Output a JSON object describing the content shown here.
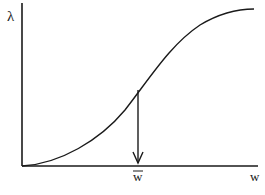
{
  "diagram": {
    "type": "sigmoid-curve-plot",
    "y_axis_label": "λ",
    "x_axis_label": "w",
    "marker_label": "w̄",
    "marker_label_base": "w",
    "marker_has_overbar": true,
    "curve": {
      "shape": "S-shaped (logistic)",
      "start": [
        22,
        166
      ],
      "inflection_approx": [
        138,
        90
      ],
      "end": [
        254,
        9
      ]
    },
    "arrow": {
      "from": [
        138,
        90
      ],
      "to": [
        138,
        163
      ],
      "direction": "down"
    },
    "colors": {
      "ink": "#1a1a1a",
      "background": "#ffffff"
    }
  }
}
